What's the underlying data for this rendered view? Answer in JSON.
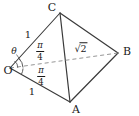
{
  "figure": {
    "type": "geometry-diagram",
    "background_color": "#ffffff",
    "stroke_color": "#3a3a3a",
    "dash_color": "#8a8a8a",
    "text_color": "#1a1a1a",
    "width": 139,
    "height": 116
  },
  "vertices": [
    {
      "id": "O",
      "label": "O",
      "x": 10,
      "y": 68,
      "label_x": 8,
      "label_y": 70
    },
    {
      "id": "C",
      "label": "C",
      "x": 60,
      "y": 13,
      "label_x": 52,
      "label_y": 7
    },
    {
      "id": "A",
      "label": "A",
      "x": 70,
      "y": 102,
      "label_x": 76,
      "label_y": 109
    },
    {
      "id": "B",
      "label": "B",
      "x": 118,
      "y": 53,
      "label_x": 127,
      "label_y": 51
    }
  ],
  "edges": [
    {
      "id": "OC",
      "from": "O",
      "to": "C",
      "style": "solid"
    },
    {
      "id": "OA",
      "from": "O",
      "to": "A",
      "style": "solid"
    },
    {
      "id": "CA",
      "from": "C",
      "to": "A",
      "style": "solid"
    },
    {
      "id": "CB",
      "from": "C",
      "to": "B",
      "style": "solid"
    },
    {
      "id": "AB",
      "from": "A",
      "to": "B",
      "style": "solid"
    },
    {
      "id": "OB",
      "from": "O",
      "to": "B",
      "style": "dashed"
    }
  ],
  "edge_labels": [
    {
      "id": "OC-length",
      "text": "1",
      "x": 28,
      "y": 35
    },
    {
      "id": "OA-length",
      "text": "1",
      "x": 32,
      "y": 92
    },
    {
      "id": "OB-length",
      "numerator": "2",
      "symbol": "√",
      "x": 81,
      "y": 49
    }
  ],
  "angles": [
    {
      "id": "angle-upper",
      "numerator": "π",
      "denominator": "4",
      "label_x": 40,
      "label_y": 51,
      "arc_radius": 13,
      "start_deg": -47,
      "end_deg": -2
    },
    {
      "id": "angle-lower",
      "numerator": "π",
      "denominator": "4",
      "label_x": 41,
      "label_y": 76,
      "arc_radius": 13,
      "start_deg": 2,
      "end_deg": 28
    }
  ],
  "annotations": [
    {
      "id": "theta",
      "text": "θ",
      "x": 14,
      "y": 51
    }
  ]
}
